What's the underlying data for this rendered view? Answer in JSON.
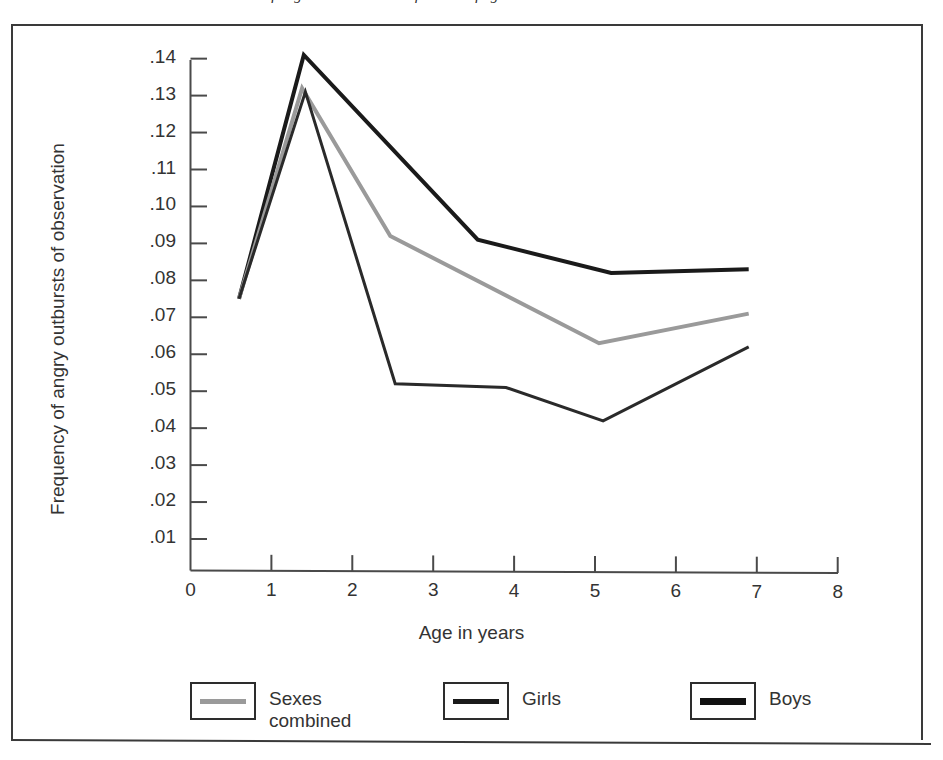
{
  "caption": {
    "visible_fragment": "FIGURE 13.2  Outbursts of anger in children as a function of age and sex"
  },
  "chart_data": {
    "type": "line",
    "title": "",
    "xlabel": "Age in years",
    "ylabel": "Frequency of angry outbursts of observation",
    "xlim": [
      0,
      8
    ],
    "ylim": [
      0,
      0.145
    ],
    "grid": false,
    "legend_position": "bottom",
    "xticks": [
      "0",
      "1",
      "2",
      "3",
      "4",
      "5",
      "6",
      "7",
      "8"
    ],
    "xtick_values": [
      0,
      1,
      2,
      3,
      4,
      5,
      6,
      7,
      8
    ],
    "yticks": [
      ".01",
      ".02",
      ".03",
      ".04",
      ".05",
      ".06",
      ".07",
      ".08",
      ".09",
      ".10",
      ".11",
      ".12",
      ".13",
      ".14"
    ],
    "ytick_values": [
      0.01,
      0.02,
      0.03,
      0.04,
      0.05,
      0.06,
      0.07,
      0.08,
      0.09,
      0.1,
      0.11,
      0.12,
      0.13,
      0.14
    ],
    "series": [
      {
        "name": "Boys",
        "color": "#1a1a1a",
        "width": 4.0,
        "x": [
          0.6,
          1.4,
          3.55,
          5.2,
          6.9
        ],
        "y": [
          0.075,
          0.141,
          0.091,
          0.082,
          0.083
        ]
      },
      {
        "name": "Sexes combined",
        "color": "#9a9a9a",
        "width": 4.0,
        "x": [
          0.6,
          1.38,
          2.47,
          5.05,
          6.9
        ],
        "y": [
          0.075,
          0.132,
          0.092,
          0.063,
          0.071
        ]
      },
      {
        "name": "Girls",
        "color": "#2a2a2a",
        "width": 3.0,
        "x": [
          0.6,
          1.42,
          2.53,
          3.9,
          5.1,
          6.9
        ],
        "y": [
          0.075,
          0.131,
          0.052,
          0.051,
          0.042,
          0.062
        ]
      }
    ]
  },
  "legend": {
    "entries": [
      {
        "label": "Sexes\ncombined",
        "color": "#9a9a9a",
        "thickness": "5px"
      },
      {
        "label": "Girls",
        "color": "#1a1a1a",
        "thickness": "5px"
      },
      {
        "label": "Boys",
        "color": "#111111",
        "thickness": "7px"
      }
    ]
  },
  "axes": {
    "y_title": "Frequency of angry outbursts of observation",
    "x_title": "Age in years"
  }
}
